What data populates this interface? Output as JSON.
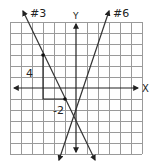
{
  "diagram": {
    "type": "coordinate-grid-with-lines",
    "grid": {
      "columns": 12,
      "rows": 12,
      "x_range": [
        -6,
        6
      ],
      "y_range": [
        -6,
        6
      ],
      "cell_px": 11
    },
    "axes": {
      "x_label": "X",
      "y_label": "Y"
    },
    "lines": [
      {
        "id": "line-3",
        "label": "#3",
        "slope": -2,
        "intercept": -3,
        "points": [
          [
            -3,
            3
          ],
          [
            -1,
            -1
          ]
        ]
      },
      {
        "id": "line-6",
        "label": "#6",
        "slope": 3,
        "intercept": -2
      }
    ],
    "slope_triangle": {
      "rise_label": "4",
      "run_label": "-2"
    },
    "colors": {
      "grid": "#9a9a9a",
      "axis": "#222222",
      "line": "#333333",
      "background": "#ffffff"
    }
  }
}
